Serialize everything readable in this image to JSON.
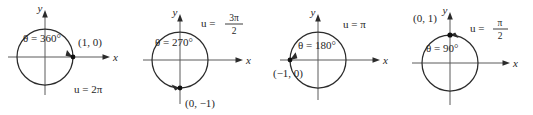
{
  "figure": {
    "name": "unit-circle-angle-sequence",
    "axis_labels": {
      "x": "x",
      "y": "y"
    },
    "colors": {
      "circle": "#2b2b2b",
      "axis": "#5a5a5a",
      "text": "#262626",
      "dot": "#111111",
      "background": "#ffffff"
    },
    "panels": [
      {
        "id": "panel-360",
        "theta_label": "θ = 360°",
        "u_label": "u = 2π",
        "u_is_fraction": false,
        "u_numerator": "",
        "u_denominator": "",
        "point_label": "(1, 0)",
        "terminal_point": [
          1,
          0
        ],
        "angle_degrees": 360
      },
      {
        "id": "panel-270",
        "theta_label": "θ = 270°",
        "u_label": "u =",
        "u_is_fraction": true,
        "u_numerator": "3π",
        "u_denominator": "2",
        "point_label": "(0, −1)",
        "terminal_point": [
          0,
          -1
        ],
        "angle_degrees": 270
      },
      {
        "id": "panel-180",
        "theta_label": "θ = 180°",
        "u_label": "u = π",
        "u_is_fraction": false,
        "u_numerator": "",
        "u_denominator": "",
        "point_label": "(−1, 0)",
        "terminal_point": [
          -1,
          0
        ],
        "angle_degrees": 180
      },
      {
        "id": "panel-90",
        "theta_label": "θ = 90°",
        "u_label": "u =",
        "u_is_fraction": true,
        "u_numerator": "π",
        "u_denominator": "2",
        "point_label": "(0, 1)",
        "terminal_point": [
          0,
          1
        ],
        "angle_degrees": 90
      }
    ]
  }
}
